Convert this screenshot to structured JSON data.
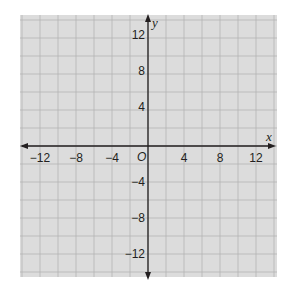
{
  "diagram": {
    "type": "coordinate-plane",
    "axes": {
      "x": {
        "label": "x",
        "min": -14,
        "max": 14,
        "ticks": [
          "-12",
          "-8",
          "-4",
          "4",
          "8",
          "12"
        ]
      },
      "y": {
        "label": "y",
        "min": -14,
        "max": 14,
        "ticks": [
          "12",
          "8",
          "4",
          "-4",
          "-8",
          "-12"
        ]
      },
      "origin_label": "O"
    },
    "grid": {
      "step": 2,
      "visible": true
    },
    "colors": {
      "grid_fill": "#dcdcdc",
      "grid_line": "#b4b4b4",
      "axis": "#231f20",
      "background": "#ffffff"
    }
  }
}
